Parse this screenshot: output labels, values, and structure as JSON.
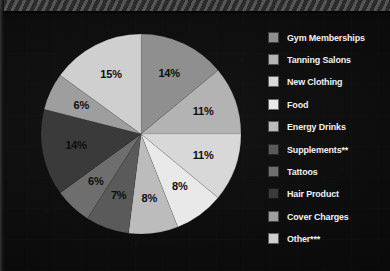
{
  "chart_data": {
    "type": "pie",
    "title": "",
    "subtitle": "",
    "xlabel": "",
    "ylabel": "",
    "legend_position": "right",
    "grid": false,
    "units": "percent",
    "start_angle_deg": 0,
    "direction": "clockwise",
    "categories": [
      "Gym Memberships",
      "Tanning Salons",
      "New Clothing",
      "Food",
      "Energy Drinks",
      "Supplements**",
      "Tattoos",
      "Hair Product",
      "Cover Charges",
      "Other***"
    ],
    "values": [
      14,
      11,
      11,
      8,
      8,
      7,
      6,
      14,
      6,
      15
    ],
    "labels": [
      "14%",
      "11%",
      "11%",
      "8%",
      "8%",
      "7%",
      "6%",
      "14%",
      "6%",
      "15%"
    ],
    "colors": [
      "#8f8f8f",
      "#b3b3b3",
      "#d8d8d8",
      "#e9e9e9",
      "#bcbcbc",
      "#5a5a5a",
      "#6e6e6e",
      "#3a3a3a",
      "#9e9e9e",
      "#cfcfcf"
    ],
    "slice_label_color": "#0d0d0d"
  },
  "legend": {
    "items": [
      {
        "label": "Gym Memberships",
        "color": "#8f8f8f",
        "value": 14,
        "value_label": "14%"
      },
      {
        "label": "Tanning Salons",
        "color": "#b3b3b3",
        "value": 11,
        "value_label": "11%"
      },
      {
        "label": "New Clothing",
        "color": "#d8d8d8",
        "value": 11,
        "value_label": "11%"
      },
      {
        "label": "Food",
        "color": "#e9e9e9",
        "value": 8,
        "value_label": "8%"
      },
      {
        "label": "Energy Drinks",
        "color": "#bcbcbc",
        "value": 8,
        "value_label": "8%"
      },
      {
        "label": "Supplements**",
        "color": "#5a5a5a",
        "value": 7,
        "value_label": "7%"
      },
      {
        "label": "Tattoos",
        "color": "#6e6e6e",
        "value": 6,
        "value_label": "6%"
      },
      {
        "label": "Hair Product",
        "color": "#3a3a3a",
        "value": 14,
        "value_label": "14%"
      },
      {
        "label": "Cover Charges",
        "color": "#9e9e9e",
        "value": 6,
        "value_label": "6%"
      },
      {
        "label": "Other***",
        "color": "#cfcfcf",
        "value": 15,
        "value_label": "15%"
      }
    ]
  },
  "theme": {
    "background": "#0c0c0c",
    "text_color": "#f2f2f2",
    "accent": "#5f5f5f"
  }
}
